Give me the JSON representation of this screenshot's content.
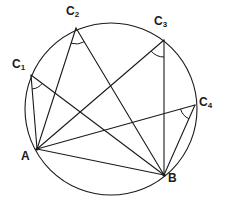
{
  "figure": {
    "width": 226,
    "height": 204,
    "background_color": "#ffffff",
    "stroke_color": "#1a1a1a",
    "stroke_width": 1
  },
  "circle": {
    "name": "circumscribed-circle",
    "center_x": 111,
    "center_y": 109,
    "radius": 86
  },
  "points": [
    {
      "id": "A",
      "label": "A",
      "sub": "",
      "x": 37,
      "y": 149
    },
    {
      "id": "B",
      "label": "B",
      "sub": "",
      "x": 164,
      "y": 175
    },
    {
      "id": "C1",
      "label": "C",
      "sub": "1",
      "x": 31,
      "y": 75
    },
    {
      "id": "C2",
      "label": "C",
      "sub": "2",
      "x": 76,
      "y": 28
    },
    {
      "id": "C3",
      "label": "C",
      "sub": "3",
      "x": 164,
      "y": 40
    },
    {
      "id": "C4",
      "label": "C",
      "sub": "4",
      "x": 195,
      "y": 105
    }
  ],
  "chords": [
    {
      "name": "chord-AB",
      "from": "A",
      "to": "B"
    },
    {
      "name": "chord-C1-A",
      "from": "C1",
      "to": "A"
    },
    {
      "name": "chord-C1-B",
      "from": "C1",
      "to": "B"
    },
    {
      "name": "chord-C2-A",
      "from": "C2",
      "to": "A"
    },
    {
      "name": "chord-C2-B",
      "from": "C2",
      "to": "B"
    },
    {
      "name": "chord-C3-A",
      "from": "C3",
      "to": "A"
    },
    {
      "name": "chord-C3-B",
      "from": "C3",
      "to": "B"
    },
    {
      "name": "chord-C4-A",
      "from": "C4",
      "to": "A"
    },
    {
      "name": "chord-C4-B",
      "from": "C4",
      "to": "B"
    }
  ],
  "angle_marks": [
    {
      "name": "angle-arc-C1",
      "vertex": "C1",
      "radius": 14
    },
    {
      "name": "angle-arc-C2",
      "vertex": "C2",
      "radius": 16
    },
    {
      "name": "angle-arc-C3",
      "vertex": "C3",
      "radius": 17
    },
    {
      "name": "angle-arc-C4",
      "vertex": "C4",
      "radius": 15
    }
  ],
  "labels": {
    "A": "A",
    "B": "B",
    "C1": "C",
    "C2": "C",
    "C3": "C",
    "C4": "C",
    "C1_sub": "1",
    "C2_sub": "2",
    "C3_sub": "3",
    "C4_sub": "4"
  }
}
